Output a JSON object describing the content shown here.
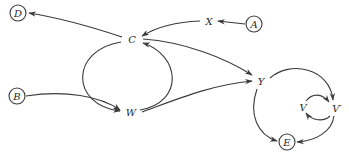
{
  "diagram": {
    "type": "directed-graph",
    "stroke_color": "#3a3a3a",
    "background": "#ffffff",
    "nodes": {
      "D": {
        "label": "D",
        "circled": true
      },
      "C": {
        "label": "C",
        "circled": false
      },
      "X": {
        "label": "X",
        "circled": false
      },
      "A": {
        "label": "A",
        "circled": true
      },
      "B": {
        "label": "B",
        "circled": true
      },
      "W": {
        "label": "W",
        "circled": false
      },
      "Y": {
        "label": "Y",
        "circled": false
      },
      "V": {
        "label": "V",
        "circled": false
      },
      "Vp": {
        "label": "V′",
        "circled": false
      },
      "E": {
        "label": "E",
        "circled": true
      }
    },
    "edges": [
      {
        "from": "C",
        "to": "D"
      },
      {
        "from": "A",
        "to": "X"
      },
      {
        "from": "X",
        "to": "C"
      },
      {
        "from": "C",
        "to": "W"
      },
      {
        "from": "W",
        "to": "C"
      },
      {
        "from": "B",
        "to": "W"
      },
      {
        "from": "C",
        "to": "Y"
      },
      {
        "from": "W",
        "to": "Y"
      },
      {
        "from": "Y",
        "to": "V′"
      },
      {
        "from": "V",
        "to": "V′"
      },
      {
        "from": "V′",
        "to": "V"
      },
      {
        "from": "Y",
        "to": "E"
      },
      {
        "from": "V′",
        "to": "E"
      }
    ]
  }
}
